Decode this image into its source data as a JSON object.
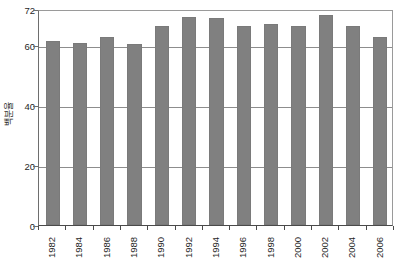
{
  "chart_data": {
    "type": "bar",
    "title": "",
    "subtitle": "",
    "xlabel": "",
    "ylabel": "백분율",
    "categories": [
      "1982",
      "1984",
      "1986",
      "1988",
      "1990",
      "1992",
      "1994",
      "1996",
      "1998",
      "2000",
      "2002",
      "2004",
      "2006"
    ],
    "values": [
      61.5,
      60.8,
      62.8,
      60.5,
      66.5,
      69.5,
      69.0,
      66.5,
      67.0,
      66.5,
      70.0,
      66.5,
      62.7
    ],
    "ylim": [
      0,
      72
    ],
    "yticks": [
      0,
      20,
      40,
      60,
      72
    ],
    "ytick_labels": [
      "0",
      "20",
      "40",
      "60",
      "72"
    ],
    "gridlines": [
      20,
      40,
      60
    ],
    "grid": true,
    "legend": null,
    "legend_position": "none",
    "bar_color": "#808080",
    "axis_color": "#4a4a4a",
    "grid_color": "#8d8d8d",
    "background": "#ffffff",
    "annotations": []
  }
}
